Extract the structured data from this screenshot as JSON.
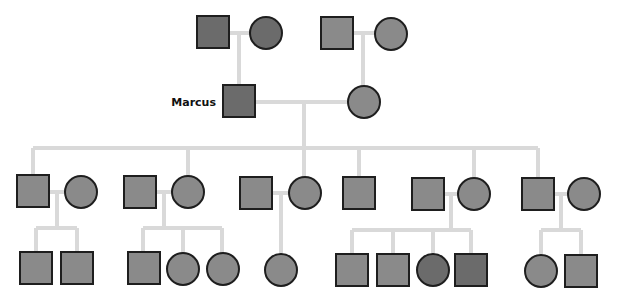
{
  "diagram": {
    "type": "pedigree-chart",
    "colors": {
      "line": "#d9d9d9",
      "fill_normal": "#8a8a8a",
      "fill_dark": "#6b6b6b",
      "stroke": "#1e1e1e"
    },
    "labels": {
      "proband": "Marcus"
    },
    "generations": [
      {
        "gen": "I",
        "individuals": [
          {
            "id": "I-1",
            "sex": "male",
            "shade": "dark"
          },
          {
            "id": "I-2",
            "sex": "female",
            "shade": "dark"
          },
          {
            "id": "I-3",
            "sex": "male",
            "shade": "normal"
          },
          {
            "id": "I-4",
            "sex": "female",
            "shade": "normal"
          }
        ]
      },
      {
        "gen": "II",
        "individuals": [
          {
            "id": "II-1",
            "sex": "male",
            "shade": "dark",
            "label": "Marcus"
          },
          {
            "id": "II-2",
            "sex": "female",
            "shade": "normal"
          }
        ]
      },
      {
        "gen": "III",
        "individuals": [
          {
            "id": "III-1",
            "sex": "male",
            "shade": "normal"
          },
          {
            "id": "III-2",
            "sex": "female",
            "shade": "normal"
          },
          {
            "id": "III-3",
            "sex": "male",
            "shade": "normal"
          },
          {
            "id": "III-4",
            "sex": "female",
            "shade": "normal"
          },
          {
            "id": "III-5",
            "sex": "male",
            "shade": "normal"
          },
          {
            "id": "III-6",
            "sex": "female",
            "shade": "normal"
          },
          {
            "id": "III-7",
            "sex": "male",
            "shade": "normal"
          },
          {
            "id": "III-8",
            "sex": "male",
            "shade": "normal"
          },
          {
            "id": "III-9",
            "sex": "female",
            "shade": "normal"
          },
          {
            "id": "III-10",
            "sex": "male",
            "shade": "normal"
          },
          {
            "id": "III-11",
            "sex": "female",
            "shade": "normal"
          }
        ]
      },
      {
        "gen": "IV",
        "individuals": [
          {
            "id": "IV-1",
            "sex": "male",
            "shade": "normal"
          },
          {
            "id": "IV-2",
            "sex": "male",
            "shade": "normal"
          },
          {
            "id": "IV-3",
            "sex": "male",
            "shade": "normal"
          },
          {
            "id": "IV-4",
            "sex": "female",
            "shade": "normal"
          },
          {
            "id": "IV-5",
            "sex": "female",
            "shade": "normal"
          },
          {
            "id": "IV-6",
            "sex": "female",
            "shade": "normal"
          },
          {
            "id": "IV-7",
            "sex": "male",
            "shade": "normal"
          },
          {
            "id": "IV-8",
            "sex": "male",
            "shade": "normal"
          },
          {
            "id": "IV-9",
            "sex": "female",
            "shade": "dark"
          },
          {
            "id": "IV-10",
            "sex": "male",
            "shade": "dark"
          },
          {
            "id": "IV-11",
            "sex": "female",
            "shade": "normal"
          },
          {
            "id": "IV-12",
            "sex": "male",
            "shade": "normal"
          }
        ]
      }
    ]
  }
}
